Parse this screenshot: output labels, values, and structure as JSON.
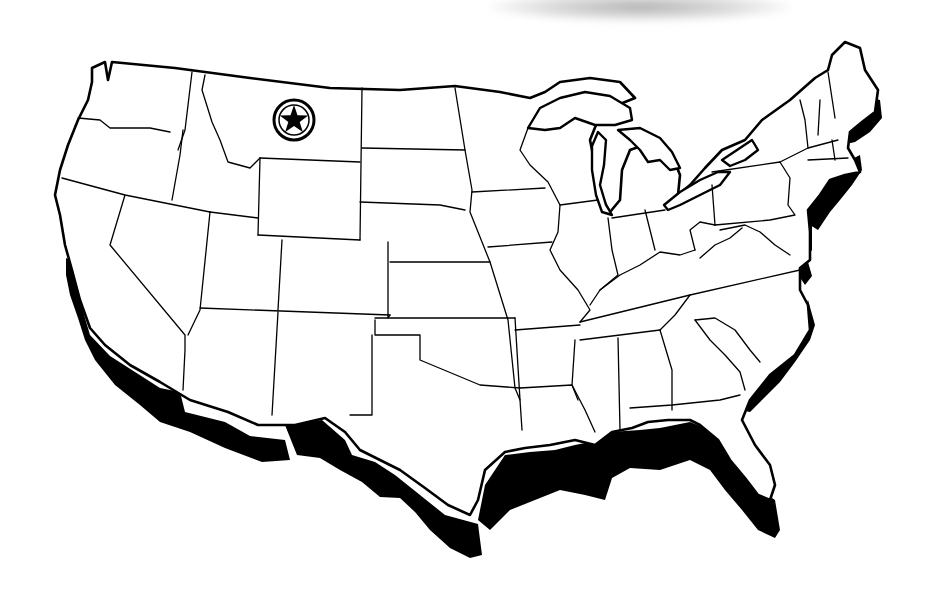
{
  "map": {
    "subject": "Contiguous United States outline map",
    "style": "black outline states on white with black coastal band",
    "colors": {
      "background": "#ffffff",
      "outline": "#000000",
      "coastal_band": "#000000",
      "scan_shadow": "#9a9a9a"
    },
    "features": [
      {
        "id": "capital-marker",
        "type": "star-in-circle",
        "icon": "star-circle-icon",
        "location_region": "Montana",
        "x": 294,
        "y": 120
      },
      {
        "id": "coastal-band-pacific",
        "type": "shaded-coast",
        "region": "Pacific coast (California)"
      },
      {
        "id": "coastal-band-gulf",
        "type": "shaded-coast",
        "region": "Gulf coast (Texas to Florida)"
      },
      {
        "id": "coastal-band-atlantic",
        "type": "shaded-coast",
        "region": "Atlantic coast (Maine to Florida)"
      },
      {
        "id": "great-lakes",
        "type": "water-bodies",
        "region": "Great Lakes"
      }
    ]
  }
}
